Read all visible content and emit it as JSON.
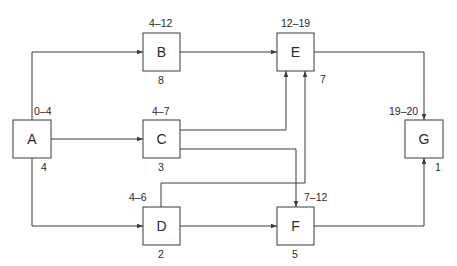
{
  "diagram": {
    "type": "activity-network",
    "colors": {
      "line": "#3a3a3a",
      "text": "#2a2a2a",
      "background": "#ffffff"
    },
    "nodes": [
      {
        "id": "A",
        "label": "A",
        "range": "0–4",
        "duration": "4"
      },
      {
        "id": "B",
        "label": "B",
        "range": "4–12",
        "duration": "8"
      },
      {
        "id": "C",
        "label": "C",
        "range": "4–7",
        "duration": "3"
      },
      {
        "id": "D",
        "label": "D",
        "range": "4–6",
        "duration": "2"
      },
      {
        "id": "E",
        "label": "E",
        "range": "12–19",
        "duration": "7"
      },
      {
        "id": "F",
        "label": "F",
        "range": "7–12",
        "duration": "5"
      },
      {
        "id": "G",
        "label": "G",
        "range": "19–20",
        "duration": "1"
      }
    ],
    "edges": [
      {
        "from": "A",
        "to": "B"
      },
      {
        "from": "A",
        "to": "C"
      },
      {
        "from": "A",
        "to": "D"
      },
      {
        "from": "B",
        "to": "E"
      },
      {
        "from": "C",
        "to": "E"
      },
      {
        "from": "C",
        "to": "F"
      },
      {
        "from": "D",
        "to": "E"
      },
      {
        "from": "D",
        "to": "F"
      },
      {
        "from": "E",
        "to": "G"
      },
      {
        "from": "F",
        "to": "G"
      }
    ]
  }
}
